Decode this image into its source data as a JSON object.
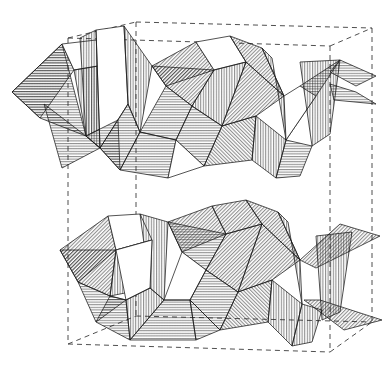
{
  "figure": {
    "kind": "crystal-structure-diagram",
    "title": "",
    "caption": "",
    "background_color": "#ffffff",
    "line_color": "#111111",
    "cell_line_color": "#3b3b3b",
    "hatch_color": "#222222",
    "projection": "oblique"
  },
  "unit_cell": {
    "style": "dashed",
    "vertices": {
      "front_bottom_left": [
        68,
        344
      ],
      "front_bottom_right": [
        330,
        352
      ],
      "front_top_left": [
        68,
        38
      ],
      "front_top_right": [
        330,
        46
      ],
      "back_bottom_left": [
        136,
        316
      ],
      "back_bottom_right": [
        372,
        322
      ],
      "back_top_left": [
        136,
        22
      ],
      "back_top_right": [
        372,
        28
      ]
    },
    "edges": [
      "front_top_left-front_top_right",
      "back_top_left-back_top_right",
      "front_top_left-back_top_left",
      "front_top_right-back_top_right",
      "front_bottom_left-front_bottom_right",
      "back_bottom_left-back_bottom_right",
      "front_bottom_left-back_bottom_left",
      "front_bottom_right-back_bottom_right",
      "front_top_left-front_bottom_left",
      "front_top_right-front_bottom_right",
      "back_top_left-back_bottom_left",
      "back_top_right-back_bottom_right"
    ]
  },
  "hatch_patterns": [
    {
      "name": "vertical",
      "angle_deg": 90,
      "spacing_px": 2.6
    },
    {
      "name": "horizontal",
      "angle_deg": 0,
      "spacing_px": 2.6
    },
    {
      "name": "diag-right",
      "angle_deg": 45,
      "spacing_px": 2.6
    },
    {
      "name": "diag-left",
      "angle_deg": -45,
      "spacing_px": 2.6
    },
    {
      "name": "blank",
      "angle_deg": 0,
      "spacing_px": 0
    }
  ],
  "polyhedra": {
    "type": "tetrahedron",
    "upper_layer_count": 14,
    "lower_layer_count": 14,
    "faces": [
      {
        "id": "u01",
        "hatch": "horizontal",
        "points": "12,92 62,44 74,70 40,118"
      },
      {
        "id": "u02",
        "hatch": "horizontal",
        "points": "12,92 40,118 86,136 62,44"
      },
      {
        "id": "u03",
        "hatch": "blank",
        "points": "62,44 74,70 110,64 96,40"
      },
      {
        "id": "u04",
        "hatch": "vertical",
        "points": "74,70 86,136 118,120 110,64"
      },
      {
        "id": "u05",
        "hatch": "blank",
        "points": "96,30 124,26 128,104 100,148"
      },
      {
        "id": "u06",
        "hatch": "vertical",
        "points": "80,38 96,30 100,148 86,136"
      },
      {
        "id": "u07",
        "hatch": "vertical",
        "points": "124,26 152,66 140,132 128,104"
      },
      {
        "id": "u08",
        "hatch": "diag-right",
        "points": "152,66 196,42 214,70 166,86"
      },
      {
        "id": "u09",
        "hatch": "diag-right",
        "points": "152,66 166,86 192,106 214,70"
      },
      {
        "id": "u10",
        "hatch": "horizontal",
        "points": "166,86 192,106 176,140 140,132"
      },
      {
        "id": "u11",
        "hatch": "blank",
        "points": "196,42 214,70 246,62 230,36"
      },
      {
        "id": "u12",
        "hatch": "vertical",
        "points": "214,70 192,106 222,126 246,62"
      },
      {
        "id": "u13",
        "hatch": "diag-right",
        "points": "230,36 246,62 284,96 262,48"
      },
      {
        "id": "u14",
        "hatch": "diag-right",
        "points": "246,62 284,96 256,116 222,126"
      },
      {
        "id": "u15",
        "hatch": "vertical",
        "points": "262,48 284,96 286,140 272,58"
      },
      {
        "id": "u16",
        "hatch": "horizontal",
        "points": "286,140 316,96 340,60 300,86"
      },
      {
        "id": "u17",
        "hatch": "blank",
        "points": "284,96 286,140 316,96 300,86"
      },
      {
        "id": "u18",
        "hatch": "vertical",
        "points": "300,62 340,60 330,134 312,146"
      },
      {
        "id": "u19",
        "hatch": "horizontal",
        "points": "340,60 376,76 356,86 330,72"
      },
      {
        "id": "u20",
        "hatch": "horizontal",
        "points": "330,84 356,92 376,104 334,100"
      },
      {
        "id": "u21",
        "hatch": "horizontal",
        "points": "44,104 86,136 100,148 62,168"
      },
      {
        "id": "u22",
        "hatch": "horizontal",
        "points": "86,136 100,148 120,170 118,120"
      },
      {
        "id": "u23",
        "hatch": "horizontal",
        "points": "100,148 128,104 140,132 120,170"
      },
      {
        "id": "u24",
        "hatch": "horizontal",
        "points": "140,132 176,140 168,178 120,170"
      },
      {
        "id": "u25",
        "hatch": "horizontal",
        "points": "176,140 192,106 222,126 204,166"
      },
      {
        "id": "u26",
        "hatch": "blank",
        "points": "176,140 204,166 168,178"
      },
      {
        "id": "u27",
        "hatch": "diag-left",
        "points": "222,126 256,116 252,160 204,166"
      },
      {
        "id": "u28",
        "hatch": "vertical",
        "points": "256,116 286,140 276,178 252,160"
      },
      {
        "id": "u29",
        "hatch": "horizontal",
        "points": "286,140 312,146 300,176 276,178"
      },
      {
        "id": "l01",
        "hatch": "diag-right",
        "points": "60,250 108,216 116,250 78,282"
      },
      {
        "id": "l02",
        "hatch": "diag-right",
        "points": "60,250 78,282 110,296 116,250"
      },
      {
        "id": "l03",
        "hatch": "blank",
        "points": "108,216 116,250 152,240 140,214"
      },
      {
        "id": "l04",
        "hatch": "vertical",
        "points": "116,250 110,296 150,288 152,240"
      },
      {
        "id": "l05",
        "hatch": "vertical",
        "points": "140,214 168,222 164,300 150,288"
      },
      {
        "id": "l06",
        "hatch": "blank",
        "points": "116,250 152,240 150,288 126,300"
      },
      {
        "id": "l07",
        "hatch": "diag-right",
        "points": "168,222 212,206 226,234 182,252"
      },
      {
        "id": "l08",
        "hatch": "horizontal",
        "points": "168,222 182,252 206,270 226,234"
      },
      {
        "id": "l09",
        "hatch": "blank",
        "points": "182,252 206,270 190,300 164,300"
      },
      {
        "id": "l10",
        "hatch": "diag-right",
        "points": "212,206 226,234 262,224 246,200"
      },
      {
        "id": "l11",
        "hatch": "diag-right",
        "points": "226,234 206,270 238,292 262,224"
      },
      {
        "id": "l12",
        "hatch": "diag-right",
        "points": "246,200 262,224 300,260 278,212"
      },
      {
        "id": "l13",
        "hatch": "diag-right",
        "points": "262,224 300,260 272,280 238,292"
      },
      {
        "id": "l14",
        "hatch": "vertical",
        "points": "278,212 300,260 302,304 288,222"
      },
      {
        "id": "l15",
        "hatch": "diag-right",
        "points": "300,260 340,224 380,236 316,268"
      },
      {
        "id": "l16",
        "hatch": "diag-right",
        "points": "304,300 344,330 382,320 320,300"
      },
      {
        "id": "l17",
        "hatch": "vertical",
        "points": "316,236 352,232 340,312 322,320"
      },
      {
        "id": "l18",
        "hatch": "horizontal",
        "points": "78,282 110,296 126,300 96,322"
      },
      {
        "id": "l19",
        "hatch": "horizontal",
        "points": "110,296 126,300 130,340 96,322"
      },
      {
        "id": "l20",
        "hatch": "vertical",
        "points": "126,300 150,288 164,300 130,340"
      },
      {
        "id": "l21",
        "hatch": "horizontal",
        "points": "164,300 190,300 196,340 130,340"
      },
      {
        "id": "l22",
        "hatch": "horizontal",
        "points": "190,300 206,270 238,292 220,330"
      },
      {
        "id": "l23",
        "hatch": "horizontal",
        "points": "190,300 220,330 196,340"
      },
      {
        "id": "l24",
        "hatch": "diag-left",
        "points": "238,292 272,280 268,322 220,330"
      },
      {
        "id": "l25",
        "hatch": "vertical",
        "points": "272,280 302,304 292,346 268,322"
      },
      {
        "id": "l26",
        "hatch": "vertical",
        "points": "302,304 322,310 312,342 292,346"
      }
    ]
  }
}
